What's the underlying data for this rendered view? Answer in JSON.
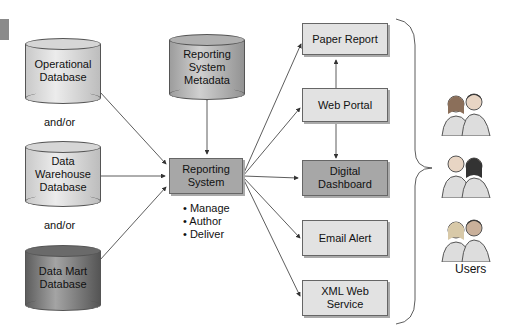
{
  "sources": [
    {
      "label_lines": [
        "Operational",
        "Database"
      ],
      "shade": "light"
    },
    {
      "label_lines": [
        "Data",
        "Warehouse",
        "Database"
      ],
      "shade": "light"
    },
    {
      "label_lines": [
        "Data Mart",
        "Database"
      ],
      "shade": "dark"
    }
  ],
  "connectors": [
    "and/or",
    "and/or"
  ],
  "metadata": {
    "label_lines": [
      "Reporting",
      "System",
      "Metadata"
    ]
  },
  "reporting_system": {
    "label_lines": [
      "Reporting",
      "System"
    ],
    "functions": [
      "• Manage",
      "• Author",
      "• Deliver"
    ]
  },
  "outputs": [
    {
      "label_lines": [
        "Paper Report"
      ],
      "shade": "light"
    },
    {
      "label_lines": [
        "Web Portal"
      ],
      "shade": "light"
    },
    {
      "label_lines": [
        "Digital",
        "Dashboard"
      ],
      "shade": "dark"
    },
    {
      "label_lines": [
        "Email Alert"
      ],
      "shade": "light"
    },
    {
      "label_lines": [
        "XML Web",
        "Service"
      ],
      "shade": "light"
    }
  ],
  "users": {
    "label": "Users",
    "icon": "people-pair-icon",
    "groups": 3
  },
  "colors": {
    "light_fill": "#e2e2e2",
    "dark_fill": "#a7a7a7",
    "line": "#333333"
  }
}
